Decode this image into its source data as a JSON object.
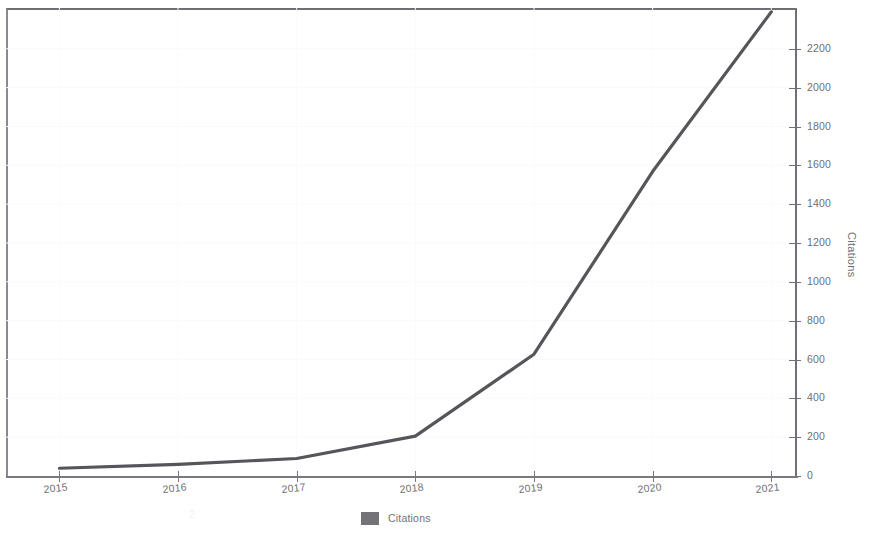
{
  "chart_data": {
    "type": "line",
    "title": "",
    "subtitle": "",
    "xlabel": "",
    "ylabel": "Citations",
    "categories": [
      "2015",
      "2016",
      "2017",
      "2018",
      "2019",
      "2020",
      "2021"
    ],
    "x": [
      2015,
      2016,
      2017,
      2018,
      2019,
      2020,
      2021
    ],
    "series": [
      {
        "name": "Citations",
        "color": "#55555a",
        "values": [
          40,
          60,
          90,
          205,
          627,
          1568,
          2390
        ]
      }
    ],
    "xlim": [
      2014.55,
      2021.2
    ],
    "ylim": [
      0,
      2410
    ],
    "y_ticks": [
      0,
      200,
      400,
      600,
      800,
      1000,
      1200,
      1400,
      1600,
      1800,
      2000,
      2200
    ],
    "y_tick_labels": [
      "0",
      "200",
      "400",
      "600",
      "800",
      "1000",
      "1200",
      "1400",
      "1600",
      "1800",
      "2000",
      "2200"
    ],
    "x_tick_labels": [
      "2015",
      "2016",
      "2017",
      "2018",
      "2019",
      "2020",
      "2021"
    ],
    "y_axis_position": "right",
    "grid": "faint",
    "legend_position": "bottom",
    "legend_entries": [
      {
        "label": "Citations",
        "color": "#5a5a60"
      }
    ],
    "annotations": [],
    "note": "Series is clipped by the top of the plot frame at the 2021 point."
  },
  "legend": {
    "citations_label": "Citations"
  },
  "axes": {
    "y_title": "Citations"
  },
  "artifact": {
    "faint_mark": "2"
  }
}
